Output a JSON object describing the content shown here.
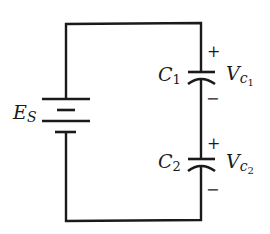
{
  "diagram": {
    "type": "series capacitor circuit",
    "source": {
      "symbol": "E",
      "subscript": "S"
    },
    "capacitors": [
      {
        "symbol": "C",
        "subscript": "1",
        "voltage_symbol": "V",
        "voltage_sub": "c",
        "voltage_subsub": "1",
        "plus": "+",
        "minus": "−"
      },
      {
        "symbol": "C",
        "subscript": "2",
        "voltage_symbol": "V",
        "voltage_sub": "c",
        "voltage_subsub": "2",
        "plus": "+",
        "minus": "−"
      }
    ],
    "colors": {
      "ink": "#1a1a1a",
      "background": "#ffffff"
    }
  }
}
